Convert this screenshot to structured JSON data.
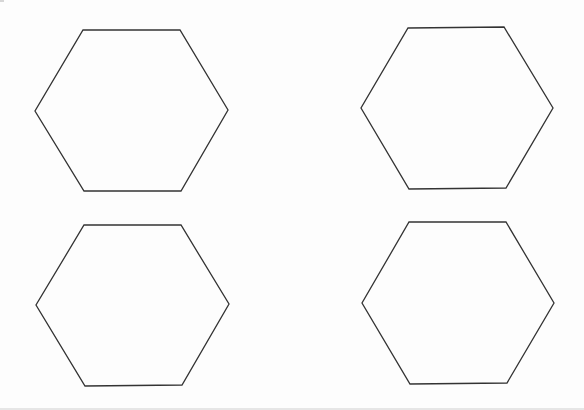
{
  "page": {
    "background": "#ffffff",
    "stroke_color": "#333333",
    "stroke_width": 1.3
  },
  "shapes": [
    {
      "id": "hexagon-top-left",
      "type": "hexagon",
      "points": "83,30 180,30 228,110 181,191 84,191 35,111"
    },
    {
      "id": "hexagon-top-right",
      "type": "hexagon",
      "points": "408,28 504,27 553,108 506,188 409,189 361,108"
    },
    {
      "id": "hexagon-bottom-left",
      "type": "hexagon",
      "points": "84,225 181,225 229,304 182,385 85,386 36,305"
    },
    {
      "id": "hexagon-bottom-right",
      "type": "hexagon",
      "points": "409,222 506,222 554,303 507,383 410,384 362,303"
    }
  ]
}
